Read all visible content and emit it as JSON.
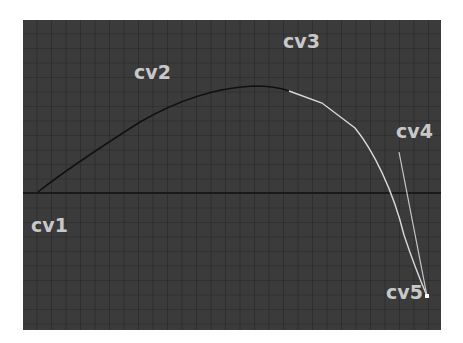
{
  "viewport": {
    "background": "#3b3b3b",
    "grid_color": "#262626",
    "axis_color": "#1a1a1a",
    "grid_spacing": 14.5,
    "axis_y": 173
  },
  "curve": {
    "unselected_color": "#111111",
    "selected_color": "#d8d8d8",
    "hull_color": "#c8c8c8"
  },
  "labels": {
    "cv1": "cv1",
    "cv2": "cv2",
    "cv3": "cv3",
    "cv4": "cv4",
    "cv5": "cv5"
  }
}
